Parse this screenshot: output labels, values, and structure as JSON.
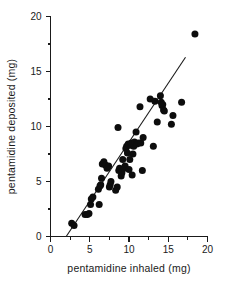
{
  "chart_data": {
    "type": "scatter",
    "title": "",
    "xlabel": "pentamidine inhaled (mg)",
    "ylabel": "pentamidine deposited (mg)",
    "xlim": [
      0,
      20
    ],
    "ylim": [
      0,
      20
    ],
    "xticks": [
      0,
      5,
      10,
      15,
      20
    ],
    "xtick_labels": [
      "0",
      "5",
      "10",
      "15",
      "20"
    ],
    "xminor_ticks": [
      2.5,
      7.5,
      12.5,
      17.5
    ],
    "yticks": [
      0,
      5,
      10,
      15,
      20
    ],
    "ytick_labels": [
      "0",
      "5",
      "10",
      "15",
      "20"
    ],
    "yminor_ticks": [
      2.5,
      7.5,
      12.5,
      17.5
    ],
    "grid": false,
    "legend": null,
    "marker": "filled-circle",
    "marker_color": "#0d0d0d",
    "marker_size_px": 4.6,
    "axis_color": "#1a1a1a",
    "background_color": "#ffffff",
    "fit_line": {
      "label": "regression line",
      "color": "#1a1a1a",
      "x_start": 2.0,
      "y_start": 0.0,
      "x_end": 17.2,
      "y_end": 16.3,
      "slope": 1.072,
      "intercept": -2.145
    },
    "x": [
      2.7,
      3.0,
      4.4,
      4.7,
      4.9,
      5.1,
      5.2,
      5.4,
      6.1,
      6.2,
      6.3,
      6.4,
      6.5,
      6.6,
      6.8,
      7.0,
      7.2,
      7.4,
      7.5,
      7.6,
      7.7,
      8.3,
      8.5,
      8.6,
      8.7,
      8.8,
      9.0,
      9.1,
      9.2,
      9.4,
      9.5,
      9.6,
      9.7,
      9.8,
      9.9,
      10.0,
      10.1,
      10.2,
      10.3,
      10.4,
      10.5,
      10.6,
      10.7,
      10.9,
      11.0,
      11.2,
      11.4,
      11.5,
      11.7,
      11.8,
      12.7,
      13.1,
      13.3,
      13.6,
      14.0,
      14.1,
      14.2,
      14.3,
      14.4,
      14.5,
      15.4,
      15.6,
      16.7,
      18.4
    ],
    "y": [
      1.2,
      1.0,
      2.0,
      2.0,
      2.1,
      2.9,
      3.4,
      3.6,
      4.3,
      2.9,
      4.6,
      4.7,
      5.3,
      6.6,
      6.8,
      6.5,
      6.2,
      6.4,
      4.5,
      4.7,
      5.0,
      4.2,
      4.5,
      9.9,
      6.0,
      6.2,
      5.5,
      5.8,
      7.0,
      6.2,
      6.4,
      8.0,
      8.2,
      7.6,
      8.4,
      6.1,
      7.0,
      8.3,
      8.5,
      5.6,
      7.5,
      8.2,
      8.6,
      9.5,
      8.4,
      8.5,
      11.8,
      8.5,
      6.0,
      9.0,
      12.5,
      8.2,
      12.3,
      10.4,
      12.8,
      12.2,
      11.9,
      12.0,
      11.5,
      11.4,
      10.2,
      11.0,
      12.2,
      18.4
    ]
  }
}
